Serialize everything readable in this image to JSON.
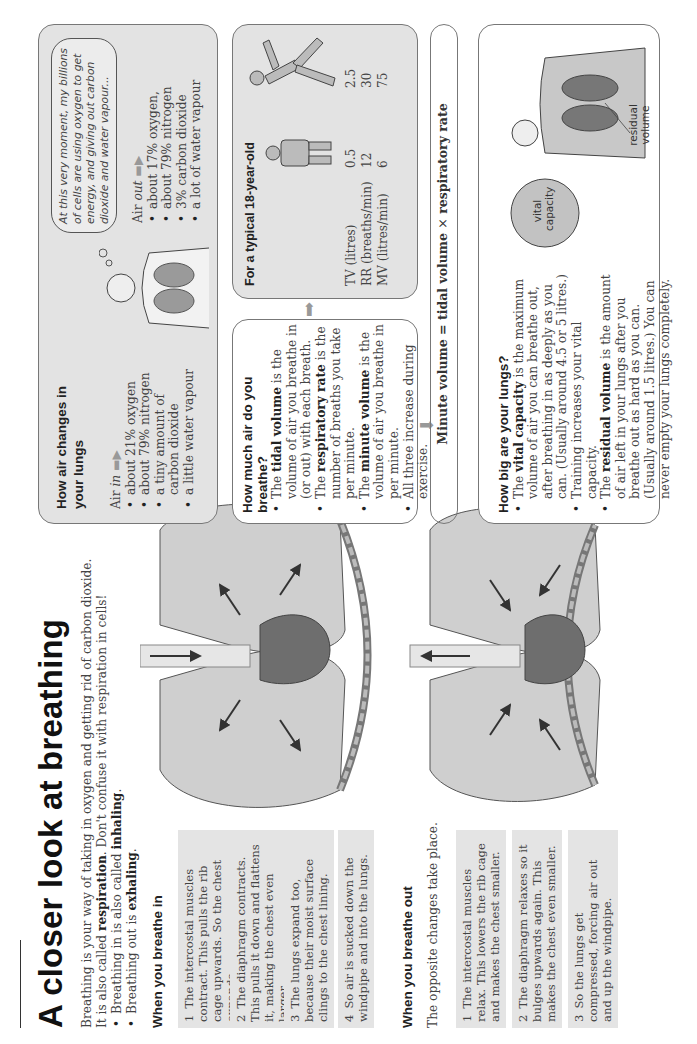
{
  "page": {
    "title": "A closer look at breathing",
    "intro": {
      "line1": "Breathing is your way of taking in oxygen and getting rid of carbon dioxide.",
      "line2_pre": "It is also called ",
      "line2_bold": "respiration",
      "line2_post": ". Don't confuse it with respiration in cells!",
      "bullets": [
        {
          "pre": "Breathing in is also called ",
          "bold": "inhaling",
          "post": "."
        },
        {
          "pre": "Breathing out is ",
          "bold": "exhaling",
          "post": "."
        }
      ]
    },
    "breathe_in": {
      "heading": "When you breathe in",
      "steps": [
        {
          "num": "1",
          "text": "The intercostal muscles contract. This pulls the rib cage upwards. So the chest expands."
        },
        {
          "num": "2",
          "text": "The diaphragm contracts. This pulls it down and flattens it, making the chest even larger."
        },
        {
          "num": "3",
          "text": "The lungs expand too, because their moist surface clings to the chest lining."
        },
        {
          "num": "4",
          "text": "So air is sucked down the windpipe and into the lungs."
        }
      ]
    },
    "breathe_out": {
      "heading": "When you breathe out",
      "intro": "The opposite changes take place.",
      "steps": [
        {
          "num": "1",
          "text": "The intercostal muscles relax. This lowers the rib cage and makes the chest smaller."
        },
        {
          "num": "2",
          "text": "The diaphragm relaxes so it bulges upwards again. This makes the chest even smaller."
        },
        {
          "num": "3",
          "text": "So the lungs get compressed, forcing air out and up the windpipe."
        }
      ]
    },
    "air_changes": {
      "heading": "How air changes in your lungs",
      "thought": "At this very moment, my billions of cells are using oxygen to get energy, and giving out carbon dioxide and water vapour...",
      "air_in": {
        "label_pre": "Air ",
        "label_em": "in",
        "items": [
          "about 21% oxygen",
          "about 79% nitrogen",
          "a tiny amount of carbon dioxide",
          "a little water vapour"
        ]
      },
      "air_out": {
        "label_pre": "Air ",
        "label_em": "out",
        "items": [
          "about 17% oxygen,",
          "about 79% nitrogen",
          "3% carbon dioxide",
          "a lot of water vapour"
        ]
      }
    },
    "how_much": {
      "heading": "How much air do you breathe?",
      "bullets": [
        {
          "pre": "The ",
          "bold": "tidal volume",
          "post": " is the volume of air you breathe in (or out) with each breath."
        },
        {
          "pre": "The ",
          "bold": "respiratory rate",
          "post": " is the number of breaths you take per minute."
        },
        {
          "pre": "The ",
          "bold": "minute volume",
          "post": " is the volume of air you breathe in per minute."
        },
        {
          "pre": "All three increase during exercise.",
          "bold": "",
          "post": ""
        }
      ]
    },
    "typical": {
      "heading": "For a typical 18-year-old",
      "rows": [
        {
          "label": "TV (litres)",
          "rest": "0.5",
          "exercise": "2.5"
        },
        {
          "label": "RR (breaths/min)",
          "rest": "12",
          "exercise": "30"
        },
        {
          "label": "MV (litres/min)",
          "rest": "6",
          "exercise": "75"
        }
      ]
    },
    "formula": {
      "left": "Minute volume = tidal volume",
      "times": "×",
      "right": "respiratory rate"
    },
    "lungs_size": {
      "heading": "How big are your lungs?",
      "bullets": [
        {
          "pre": "The ",
          "bold": "vital capacity",
          "post": " is the maximum volume of air you can breathe out, after breathing in as deeply as you can. (Usually around 4.5 or 5 litres.)"
        },
        {
          "pre": "Training increases your vital capacity.",
          "bold": "",
          "post": ""
        },
        {
          "pre": "The ",
          "bold": "residual volume",
          "post": " is the amount of air left in your lungs after you breathe out as hard as you can. (Usually around 1.5 litres.) You can never empty your lungs completely."
        }
      ],
      "label_vital": "vital capacity",
      "label_residual": "residual volume"
    },
    "colors": {
      "box_grey": "#e3e3e3",
      "lung_fill": "#c8c8c8",
      "heart_fill": "#6e6e6e",
      "border": "#777777"
    }
  }
}
